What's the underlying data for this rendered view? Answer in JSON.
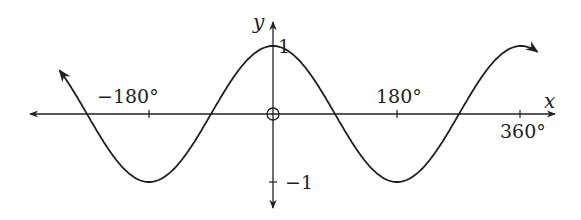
{
  "chart_data": {
    "type": "line",
    "title": "",
    "function": "y = cos x",
    "xlabel": "x",
    "ylabel": "y",
    "x_unit": "degrees",
    "xlim": [
      -310,
      385
    ],
    "ylim": [
      -1,
      1
    ],
    "x_ticks": [
      {
        "value": -180,
        "label": "−180°"
      },
      {
        "value": 180,
        "label": "180°"
      },
      {
        "value": 360,
        "label": "360°"
      }
    ],
    "y_ticks": [
      {
        "value": 1,
        "label": "1"
      },
      {
        "value": -1,
        "label": "−1"
      }
    ],
    "origin_label": "O",
    "grid": false,
    "legend": null,
    "series": [
      {
        "name": "cos x",
        "x": [
          -300,
          -270,
          -180,
          -90,
          0,
          90,
          180,
          270,
          360,
          380
        ],
        "values": [
          0.5,
          0,
          -1,
          0,
          1,
          0,
          -1,
          0,
          1,
          0.94
        ]
      }
    ],
    "colors": {
      "line": "#231f20",
      "background": "#ffffff"
    }
  },
  "labels": {
    "x_axis": "x",
    "y_axis": "y",
    "tick_neg180": "−180°",
    "tick_180": "180°",
    "tick_360": "360°",
    "tick_y1": "1",
    "tick_yneg1": "−1"
  }
}
